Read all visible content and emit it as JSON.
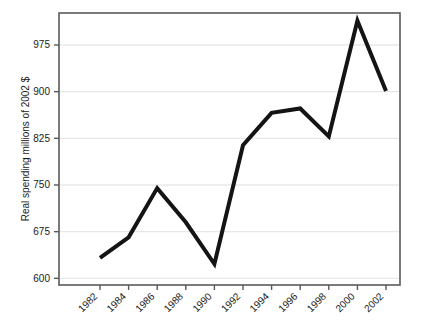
{
  "chart_data": {
    "type": "line",
    "title": "",
    "subtitle": "",
    "xlabel": "",
    "ylabel": "Real spending millions of 2002 $",
    "x": [
      1982,
      1984,
      1986,
      1988,
      1990,
      1992,
      1994,
      1996,
      1998,
      2000,
      2002
    ],
    "categories": [
      "1982",
      "1984",
      "1986",
      "1988",
      "1990",
      "1992",
      "1994",
      "1996",
      "1998",
      "2000",
      "2002"
    ],
    "values": [
      633,
      666,
      745,
      690,
      623,
      814,
      866,
      873,
      828,
      1014,
      901
    ],
    "series": [
      {
        "name": "Real spending",
        "values": [
          633,
          666,
          745,
          690,
          623,
          814,
          866,
          873,
          828,
          1014,
          901
        ]
      }
    ],
    "xlim": [
      1981,
      2003
    ],
    "ylim": [
      600,
      1025
    ],
    "yticks": [
      600,
      675,
      750,
      825,
      900,
      975
    ],
    "ytick_labels": [
      "600",
      "675",
      "750",
      "825",
      "900",
      "975"
    ],
    "xticks": [
      1982,
      1984,
      1986,
      1988,
      1990,
      1992,
      1994,
      1996,
      1998,
      2000,
      2002
    ],
    "xtick_labels": [
      "1982",
      "1984",
      "1986",
      "1988",
      "1990",
      "1992",
      "1994",
      "1996",
      "1998",
      "2000",
      "2002"
    ],
    "xtick_rotation": -45,
    "grid": "horizontal",
    "grid_color": "#e8e8e8",
    "legend": null,
    "legend_position": "none",
    "line_color": "#141414",
    "line_width": 4,
    "frame_color": "#5a5a5a",
    "background_color": "#ffffff",
    "annotations": []
  },
  "axes": {
    "ylabel": "Real spending millions of 2002 $"
  }
}
